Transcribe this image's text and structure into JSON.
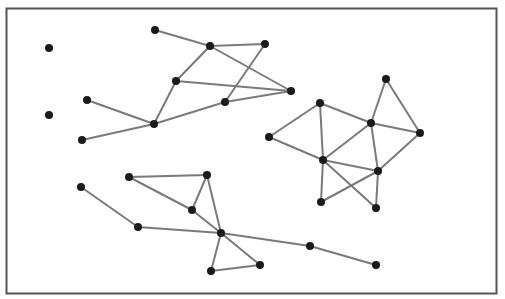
{
  "diagram": {
    "type": "undirected-graph",
    "colors": {
      "edge": "#7a7a7a",
      "node": "#1a1a1a",
      "frame": "#555555",
      "background": "#ffffff"
    },
    "nodes": [
      {
        "id": "n1"
      },
      {
        "id": "n2"
      },
      {
        "id": "n3"
      },
      {
        "id": "n4"
      },
      {
        "id": "n5"
      },
      {
        "id": "n6"
      },
      {
        "id": "n7"
      },
      {
        "id": "n8"
      },
      {
        "id": "n9"
      },
      {
        "id": "n10"
      },
      {
        "id": "n11"
      },
      {
        "id": "n12"
      },
      {
        "id": "n13"
      },
      {
        "id": "n14"
      },
      {
        "id": "n15"
      },
      {
        "id": "n16"
      },
      {
        "id": "n17"
      },
      {
        "id": "n18"
      },
      {
        "id": "n19"
      },
      {
        "id": "n20"
      },
      {
        "id": "n21"
      },
      {
        "id": "n22"
      },
      {
        "id": "n23"
      },
      {
        "id": "n24"
      },
      {
        "id": "n25"
      },
      {
        "id": "n26"
      },
      {
        "id": "n27"
      },
      {
        "id": "n28"
      },
      {
        "id": "n29"
      },
      {
        "id": "n30"
      }
    ],
    "edges": [
      [
        "n5",
        "n6"
      ],
      [
        "n6",
        "n7"
      ],
      [
        "n6",
        "n8"
      ],
      [
        "n6",
        "n9"
      ],
      [
        "n7",
        "n10"
      ],
      [
        "n8",
        "n9"
      ],
      [
        "n8",
        "n11"
      ],
      [
        "n10",
        "n9"
      ],
      [
        "n11",
        "n10"
      ],
      [
        "n11",
        "n3"
      ],
      [
        "n11",
        "n4"
      ],
      [
        "n12",
        "n14"
      ],
      [
        "n12",
        "n15"
      ],
      [
        "n13",
        "n14"
      ],
      [
        "n13",
        "n16"
      ],
      [
        "n13",
        "n17"
      ],
      [
        "n14",
        "n15"
      ],
      [
        "n14",
        "n17"
      ],
      [
        "n14",
        "n18"
      ],
      [
        "n15",
        "n18"
      ],
      [
        "n16",
        "n17"
      ],
      [
        "n17",
        "n18"
      ],
      [
        "n17",
        "n19"
      ],
      [
        "n17",
        "n20"
      ],
      [
        "n18",
        "n19"
      ],
      [
        "n18",
        "n20"
      ],
      [
        "n21",
        "n25"
      ],
      [
        "n22",
        "n23"
      ],
      [
        "n22",
        "n24"
      ],
      [
        "n23",
        "n24"
      ],
      [
        "n23",
        "n26"
      ],
      [
        "n24",
        "n26"
      ],
      [
        "n25",
        "n26"
      ],
      [
        "n26",
        "n27"
      ],
      [
        "n26",
        "n28"
      ],
      [
        "n27",
        "n28"
      ],
      [
        "n26",
        "n29"
      ],
      [
        "n29",
        "n30"
      ]
    ]
  }
}
